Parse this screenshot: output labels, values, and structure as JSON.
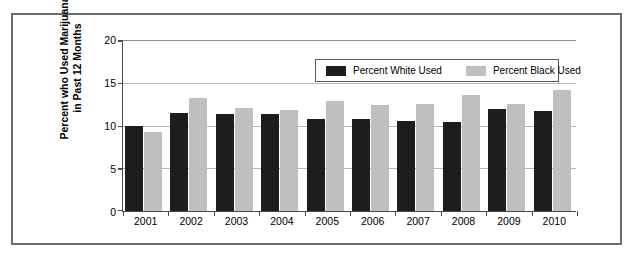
{
  "chart_data": {
    "type": "bar",
    "title": "",
    "xlabel": "",
    "ylabel": "Percent who Used Marijuana in Past 12 Months",
    "ylabel_line1": "Percent who Used Marijuana",
    "ylabel_line2": "in Past 12 Months",
    "categories": [
      "2001",
      "2002",
      "2003",
      "2004",
      "2005",
      "2006",
      "2007",
      "2008",
      "2009",
      "2010"
    ],
    "series": [
      {
        "name": "Percent White Used",
        "color": "#1d1d1d",
        "values": [
          9.9,
          11.4,
          11.3,
          11.3,
          10.7,
          10.7,
          10.5,
          10.4,
          11.9,
          11.6
        ]
      },
      {
        "name": "Percent Black Used",
        "color": "#bfbfbf",
        "values": [
          9.2,
          13.1,
          12.0,
          11.7,
          12.8,
          12.3,
          12.4,
          13.5,
          12.4,
          14.1
        ]
      }
    ],
    "ylim": [
      0,
      20
    ],
    "yticks": [
      0,
      5,
      10,
      15,
      20
    ],
    "ytick_labels": [
      "0",
      "5",
      "10",
      "15",
      "20"
    ],
    "grid": true,
    "legend_position": "top-right-inside"
  },
  "legend": {
    "items": [
      {
        "label": "Percent White Used",
        "color": "#1d1d1d"
      },
      {
        "label": "Percent Black Used",
        "color": "#bfbfbf"
      }
    ]
  }
}
